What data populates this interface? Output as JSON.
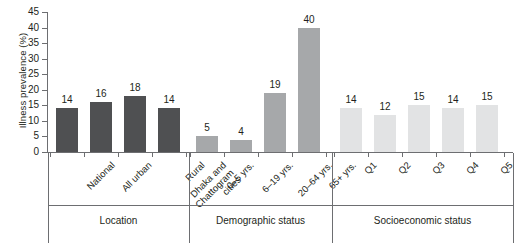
{
  "chart_data": {
    "type": "bar",
    "title": "",
    "xlabel": "",
    "ylabel": "Illness prevalence (%)",
    "ylim": [
      0,
      45
    ],
    "yticks": [
      0,
      5,
      10,
      15,
      20,
      25,
      30,
      35,
      40,
      45
    ],
    "grid": false,
    "legend": "none",
    "categories": [
      "National",
      "All urban",
      "Dhaka and Chattogram cities",
      "Rural",
      "0–5 yrs.",
      "6–19 yrs.",
      "20–64 yrs.",
      "65+ yrs.",
      "Q1",
      "Q2",
      "Q3",
      "Q4",
      "Q5"
    ],
    "values": [
      14,
      16,
      18,
      14,
      5,
      4,
      19,
      40,
      14,
      12,
      15,
      14,
      15
    ],
    "groups": [
      {
        "name": "Location",
        "color": "#4f5052",
        "categories": [
          "National",
          "All urban",
          "Dhaka and Chattogram cities",
          "Rural"
        ],
        "values": [
          14,
          16,
          18,
          14
        ]
      },
      {
        "name": "Demographic status",
        "color": "#a6a8aa",
        "categories": [
          "0–5 yrs.",
          "6–19 yrs.",
          "20–64 yrs.",
          "65+ yrs."
        ],
        "values": [
          5,
          4,
          19,
          40
        ]
      },
      {
        "name": "Socioeconomic status",
        "color": "#e2e3e4",
        "categories": [
          "Q1",
          "Q2",
          "Q3",
          "Q4",
          "Q5"
        ],
        "values": [
          14,
          12,
          15,
          14,
          15
        ]
      }
    ]
  },
  "axis": {
    "y_title": "Illness prevalence (%)",
    "ticks": [
      "45",
      "40",
      "35",
      "30",
      "25",
      "20",
      "15",
      "10",
      "5",
      "0"
    ]
  },
  "bars": [
    {
      "label": "National",
      "label_line1": "National",
      "label_line2": "",
      "value": "14",
      "group": "g-location"
    },
    {
      "label": "All urban",
      "label_line1": "All urban",
      "label_line2": "",
      "value": "16",
      "group": "g-location"
    },
    {
      "label": "Dhaka and Chattogram cities",
      "label_line1": "Dhaka and",
      "label_line2": "Chattogram",
      "label_line3": "cities",
      "value": "18",
      "group": "g-location"
    },
    {
      "label": "Rural",
      "label_line1": "Rural",
      "label_line2": "",
      "value": "14",
      "group": "g-location"
    },
    {
      "label": "0–5 yrs.",
      "label_line1": "0–5 yrs.",
      "label_line2": "",
      "value": "5",
      "group": "g-demographic"
    },
    {
      "label": "6–19 yrs.",
      "label_line1": "6–19 yrs.",
      "label_line2": "",
      "value": "4",
      "group": "g-demographic"
    },
    {
      "label": "20–64 yrs.",
      "label_line1": "20–64 yrs.",
      "label_line2": "",
      "value": "19",
      "group": "g-demographic"
    },
    {
      "label": "65+ yrs.",
      "label_line1": "65+ yrs.",
      "label_line2": "",
      "value": "40",
      "group": "g-demographic"
    },
    {
      "label": "Q1",
      "label_line1": "Q1",
      "label_line2": "",
      "value": "14",
      "group": "g-socio"
    },
    {
      "label": "Q2",
      "label_line1": "Q2",
      "label_line2": "",
      "value": "12",
      "group": "g-socio"
    },
    {
      "label": "Q3",
      "label_line1": "Q3",
      "label_line2": "",
      "value": "15",
      "group": "g-socio"
    },
    {
      "label": "Q4",
      "label_line1": "Q4",
      "label_line2": "",
      "value": "14",
      "group": "g-socio"
    },
    {
      "label": "Q5",
      "label_line1": "Q5",
      "label_line2": "",
      "value": "15",
      "group": "g-socio"
    }
  ],
  "group_labels": [
    {
      "name": "Location"
    },
    {
      "name": "Demographic status"
    },
    {
      "name": "Socioeconomic status"
    }
  ]
}
